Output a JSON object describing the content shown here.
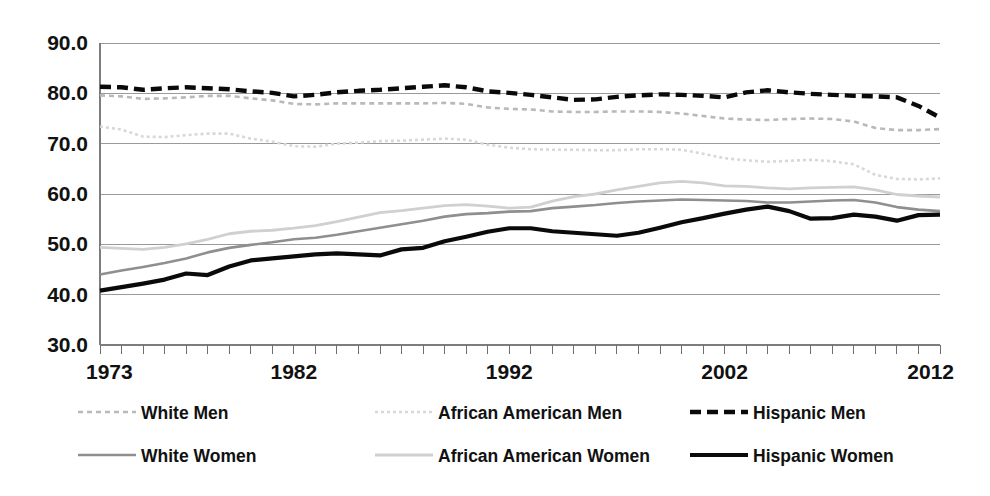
{
  "chart_data": {
    "type": "line",
    "title": "",
    "subtitle": "",
    "xlabel": "",
    "ylabel": "",
    "xlim": [
      1973,
      2012
    ],
    "ylim": [
      30.0,
      90.0
    ],
    "grid": true,
    "legend_position": "bottom",
    "y_ticks": [
      "90.0",
      "80.0",
      "70.0",
      "60.0",
      "50.0",
      "40.0",
      "30.0"
    ],
    "y_tick_values": [
      90,
      80,
      70,
      60,
      50,
      40,
      30
    ],
    "x_ticks": [
      "1973",
      "1982",
      "1992",
      "2002",
      "2012"
    ],
    "x_tick_values": [
      1973,
      1982,
      1992,
      2002,
      2012
    ],
    "x": [
      1973,
      1974,
      1975,
      1976,
      1977,
      1978,
      1979,
      1980,
      1981,
      1982,
      1983,
      1984,
      1985,
      1986,
      1987,
      1988,
      1989,
      1990,
      1991,
      1992,
      1993,
      1994,
      1995,
      1996,
      1997,
      1998,
      1999,
      2000,
      2001,
      2002,
      2003,
      2004,
      2005,
      2006,
      2007,
      2008,
      2009,
      2010,
      2011,
      2012
    ],
    "series": [
      {
        "name": "White Men",
        "key": "white_men",
        "style": "dashed",
        "color": "#b9b9b9",
        "width": 2.6,
        "dash": "5,4",
        "values": [
          79.6,
          79.4,
          78.9,
          79.0,
          79.2,
          79.5,
          79.5,
          79.0,
          78.6,
          77.9,
          77.8,
          78.0,
          78.0,
          78.0,
          78.0,
          78.0,
          78.1,
          77.9,
          77.2,
          76.9,
          76.8,
          76.4,
          76.3,
          76.3,
          76.4,
          76.4,
          76.3,
          76.0,
          75.5,
          75.0,
          74.8,
          74.7,
          74.9,
          75.0,
          74.9,
          74.4,
          73.1,
          72.7,
          72.7,
          72.9
        ]
      },
      {
        "name": "African American Men",
        "key": "african_american_men",
        "style": "dotted",
        "color": "#d8d8d8",
        "width": 2.6,
        "dash": "3,3",
        "values": [
          73.4,
          72.8,
          71.4,
          71.3,
          71.7,
          72.0,
          72.0,
          71.0,
          70.4,
          69.5,
          69.4,
          70.0,
          70.2,
          70.5,
          70.6,
          70.8,
          71.0,
          70.8,
          69.8,
          69.2,
          68.9,
          68.8,
          68.8,
          68.7,
          68.7,
          68.9,
          68.9,
          68.8,
          68.0,
          67.1,
          66.7,
          66.4,
          66.6,
          66.8,
          66.5,
          65.9,
          63.8,
          63.0,
          62.9,
          63.1
        ]
      },
      {
        "name": "Hispanic Men",
        "key": "hispanic_men",
        "style": "dashed-bold",
        "color": "#0a0a0a",
        "width": 4.4,
        "dash": "11,6",
        "values": [
          81.3,
          81.2,
          80.7,
          81.0,
          81.2,
          81.0,
          80.8,
          80.4,
          80.1,
          79.4,
          79.7,
          80.2,
          80.5,
          80.7,
          81.0,
          81.3,
          81.6,
          81.2,
          80.4,
          80.1,
          79.7,
          79.2,
          78.7,
          78.8,
          79.3,
          79.6,
          79.8,
          79.7,
          79.5,
          79.2,
          80.2,
          80.6,
          80.2,
          79.9,
          79.7,
          79.5,
          79.4,
          79.2,
          77.5,
          75.2
        ]
      },
      {
        "name": "White Women",
        "key": "white_women",
        "style": "solid",
        "color": "#8f8f8f",
        "width": 2.6,
        "dash": "",
        "values": [
          44.0,
          44.8,
          45.5,
          46.3,
          47.2,
          48.4,
          49.3,
          49.9,
          50.4,
          51.0,
          51.3,
          51.9,
          52.6,
          53.3,
          54.0,
          54.7,
          55.5,
          56.0,
          56.2,
          56.5,
          56.6,
          57.2,
          57.5,
          57.8,
          58.2,
          58.5,
          58.7,
          58.9,
          58.8,
          58.7,
          58.6,
          58.3,
          58.3,
          58.5,
          58.7,
          58.8,
          58.3,
          57.4,
          56.9,
          56.6
        ]
      },
      {
        "name": "African American Women",
        "key": "african_american_women",
        "style": "solid-light",
        "color": "#d0d0d0",
        "width": 2.8,
        "dash": "",
        "values": [
          49.4,
          49.2,
          49.0,
          49.4,
          50.1,
          51.0,
          52.1,
          52.6,
          52.8,
          53.2,
          53.7,
          54.5,
          55.4,
          56.3,
          56.7,
          57.2,
          57.7,
          57.9,
          57.6,
          57.2,
          57.4,
          58.6,
          59.5,
          60.0,
          60.8,
          61.5,
          62.2,
          62.5,
          62.2,
          61.6,
          61.5,
          61.2,
          61.0,
          61.2,
          61.3,
          61.4,
          60.8,
          59.9,
          59.6,
          59.4
        ]
      },
      {
        "name": "Hispanic Women",
        "key": "hispanic_women",
        "style": "solid-bold",
        "color": "#0a0a0a",
        "width": 4.2,
        "dash": "",
        "values": [
          40.8,
          41.5,
          42.2,
          43.0,
          44.2,
          43.9,
          45.6,
          46.8,
          47.2,
          47.6,
          48.0,
          48.2,
          48.0,
          47.8,
          49.0,
          49.3,
          50.6,
          51.5,
          52.5,
          53.2,
          53.2,
          52.6,
          52.3,
          52.0,
          51.7,
          52.3,
          53.3,
          54.4,
          55.2,
          56.1,
          56.9,
          57.5,
          56.6,
          55.1,
          55.2,
          55.9,
          55.5,
          54.7,
          55.8,
          55.9
        ]
      }
    ],
    "legend": [
      {
        "label": "White Men",
        "key": "white_men"
      },
      {
        "label": "African American Men",
        "key": "african_american_men"
      },
      {
        "label": "Hispanic Men",
        "key": "hispanic_men"
      },
      {
        "label": "White Women",
        "key": "white_women"
      },
      {
        "label": "African American Women",
        "key": "african_american_women"
      },
      {
        "label": "Hispanic Women",
        "key": "hispanic_women"
      }
    ]
  }
}
